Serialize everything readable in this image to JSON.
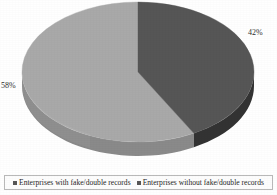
{
  "chart_data": {
    "type": "pie",
    "title": "",
    "subtitle": "",
    "xlabel": "",
    "ylabel": "",
    "grid": false,
    "legend_position": "bottom",
    "three_d": true,
    "categories": [
      "Enterprises with fake/double records",
      "Enterprises without fake/double records"
    ],
    "values": [
      42,
      58
    ],
    "slices": [
      {
        "label": "Enterprises with fake/double records",
        "value": 42,
        "data_label": "42%",
        "color": "#565656",
        "side_color": "#333333"
      },
      {
        "label": "Enterprises without fake/double records",
        "value": 58,
        "data_label": "58%",
        "color": "#a9a9a9",
        "side_color": "#8a8a8a"
      }
    ],
    "data_labels": [
      "42%",
      "58%"
    ],
    "units": "percent",
    "total": 100
  },
  "labels": {
    "right_percent": "42%",
    "left_percent": "58%"
  },
  "legend": {
    "items": [
      {
        "label": "Enterprises with fake/double records",
        "color": "#565656",
        "marker": "square-marker"
      },
      {
        "label": "Enterprises without fake/double records",
        "color": "#565656",
        "marker": "square-marker"
      }
    ]
  },
  "colors": {
    "slice_dark": "#565656",
    "slice_dark_side": "#333333",
    "slice_light": "#a9a9a9",
    "slice_light_side": "#8a8a8a",
    "background": "#ffffff",
    "legend_border": "#b9b9b9",
    "text": "#1f1f1f"
  }
}
